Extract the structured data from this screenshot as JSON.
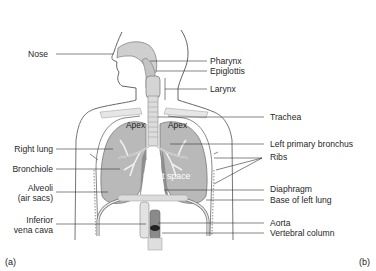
{
  "figure": {
    "panel_labels": {
      "left": "(a)",
      "right": "(b)"
    },
    "left_labels": [
      {
        "id": "nose",
        "text": "Nose"
      },
      {
        "id": "right-lung",
        "text": "Right lung"
      },
      {
        "id": "bronchiole",
        "text": "Bronchiole"
      },
      {
        "id": "alveoli",
        "text": "Alveoli",
        "text2": "(air sacs)"
      },
      {
        "id": "inferior-vena-cava",
        "text": "Inferior",
        "text2": "vena cava"
      }
    ],
    "right_labels": [
      {
        "id": "pharynx",
        "text": "Pharynx"
      },
      {
        "id": "epiglottis",
        "text": "Epiglottis"
      },
      {
        "id": "larynx",
        "text": "Larynx"
      },
      {
        "id": "trachea",
        "text": "Trachea"
      },
      {
        "id": "left-primary-bronchus",
        "text": "Left primary bronchus"
      },
      {
        "id": "ribs",
        "text": "Ribs"
      },
      {
        "id": "diaphragm",
        "text": "Diaphragm"
      },
      {
        "id": "base-of-left-lung",
        "text": "Base of left lung"
      },
      {
        "id": "aorta",
        "text": "Aorta"
      },
      {
        "id": "vertebral-column",
        "text": "Vertebral column"
      }
    ],
    "inner_labels": {
      "apex_left": "Apex",
      "apex_right": "Apex",
      "heart_space": "Heart space"
    },
    "colors": {
      "lung": "#b9b9b9",
      "lung_dark": "#8e8e8e",
      "airway": "#cfcfcf",
      "outline": "#555555",
      "leader": "#333333"
    }
  }
}
